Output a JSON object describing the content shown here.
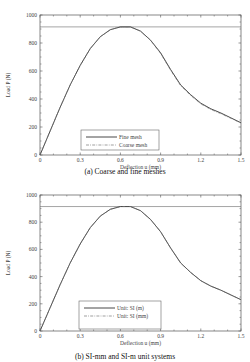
{
  "chart_data": [
    {
      "type": "line",
      "caption": "(a)  Coarse and fine meshes",
      "title": "",
      "xlabel": "Deflection u (mm)",
      "ylabel": "Load P (N)",
      "xlim": [
        0,
        1.5
      ],
      "ylim": [
        0,
        1000
      ],
      "xticks": [
        "0",
        "0.3",
        "0.6",
        "0.9",
        "1.2",
        "1.5"
      ],
      "yticks": [
        "0",
        "200",
        "400",
        "600",
        "800",
        "1000"
      ],
      "grid": false,
      "legend_position": "lower center",
      "reference_line": {
        "y": 915,
        "style": "horizontal at peak"
      },
      "x": [
        0,
        0.075,
        0.15,
        0.225,
        0.3,
        0.375,
        0.45,
        0.525,
        0.6,
        0.675,
        0.75,
        0.825,
        0.9,
        0.975,
        1.05,
        1.125,
        1.2,
        1.275,
        1.35,
        1.425,
        1.5
      ],
      "series": [
        {
          "name": "Fine mesh",
          "style": "solid",
          "values": [
            0,
            170,
            340,
            500,
            640,
            760,
            845,
            895,
            915,
            915,
            885,
            820,
            730,
            610,
            500,
            430,
            370,
            330,
            300,
            265,
            230
          ]
        },
        {
          "name": "Coarse mesh",
          "style": "dash-dot",
          "values": [
            0,
            170,
            340,
            500,
            640,
            760,
            845,
            895,
            915,
            915,
            885,
            820,
            725,
            605,
            495,
            425,
            365,
            325,
            295,
            262,
            228
          ]
        }
      ]
    },
    {
      "type": "line",
      "caption": "(b)  SI-mm and SI-m unit systems",
      "title": "",
      "xlabel": "Deflection u (mm)",
      "ylabel": "Load P (N)",
      "xlim": [
        0,
        1.5
      ],
      "ylim": [
        0,
        1000
      ],
      "xticks": [
        "0",
        "0.3",
        "0.6",
        "0.9",
        "1.2",
        "1.5"
      ],
      "yticks": [
        "0",
        "200",
        "400",
        "600",
        "800",
        "1000"
      ],
      "grid": false,
      "legend_position": "lower center",
      "reference_line": {
        "y": 915,
        "style": "horizontal at peak"
      },
      "x": [
        0,
        0.075,
        0.15,
        0.225,
        0.3,
        0.375,
        0.45,
        0.525,
        0.6,
        0.675,
        0.75,
        0.825,
        0.9,
        0.975,
        1.05,
        1.125,
        1.2,
        1.275,
        1.35,
        1.425,
        1.5
      ],
      "series": [
        {
          "name": "Unit: SI (m)",
          "style": "solid",
          "values": [
            0,
            170,
            340,
            500,
            640,
            760,
            845,
            895,
            915,
            915,
            885,
            820,
            730,
            610,
            500,
            430,
            370,
            330,
            300,
            265,
            230
          ]
        },
        {
          "name": "Unit: SI (mm)",
          "style": "dash-dot",
          "values": [
            0,
            170,
            340,
            500,
            640,
            760,
            845,
            895,
            915,
            915,
            885,
            820,
            730,
            610,
            500,
            430,
            370,
            330,
            300,
            265,
            230
          ]
        }
      ]
    }
  ],
  "panels": {
    "a": {
      "caption": "(a)  Coarse and fine meshes",
      "xlabel": "Deflection u (mm)",
      "ylabel": "Load P (N)",
      "legend": [
        "Fine mesh",
        "Coarse mesh"
      ]
    },
    "b": {
      "caption": "(b)  SI-mm and SI-m unit systems",
      "xlabel": "Deflection u (mm)",
      "ylabel": "Load P (N)",
      "legend": [
        "Unit: SI (m)",
        "Unit: SI (mm)"
      ]
    }
  },
  "colors": {
    "line": "#333333",
    "axis": "#555555",
    "dash": "#777777"
  }
}
